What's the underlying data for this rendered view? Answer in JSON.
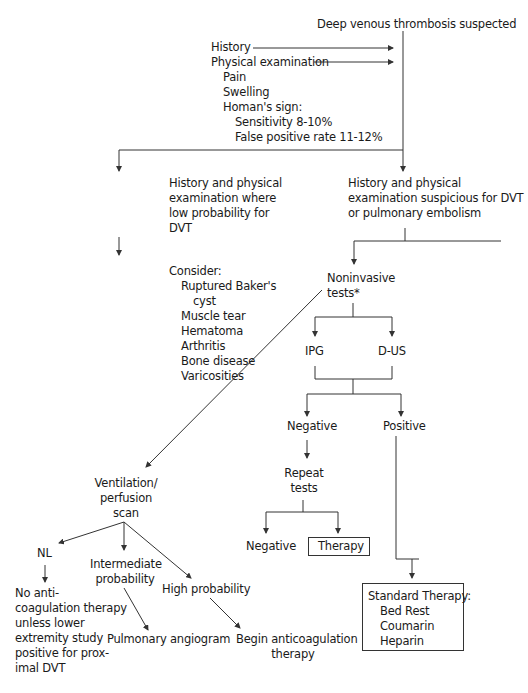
{
  "diagram": {
    "title": "Deep venous thrombosis suspected",
    "inputs": {
      "history": "History",
      "physical_exam": "Physical examination",
      "exam_items": [
        "Pain",
        "Swelling",
        "Homan's sign:"
      ],
      "homans_stats": [
        "Sensitivity 8-10%",
        "False positive rate 11-12%"
      ]
    },
    "low_prob": {
      "text": [
        "History and physical",
        "examination where",
        "low probability for",
        "DVT"
      ],
      "consider_label": "Consider:",
      "consider_items": [
        "Ruptured Baker's",
        "cyst",
        "Muscle tear",
        "Hematoma",
        "Arthritis",
        "Bone disease",
        "Varicosities"
      ]
    },
    "suspicious": {
      "text": [
        "History and physical",
        "examination suspicious for DVT",
        "or pulmonary embolism"
      ]
    },
    "noninvasive": {
      "text": [
        "Noninvasive",
        "tests*"
      ],
      "ipg": "IPG",
      "dus": "D-US",
      "negative": "Negative",
      "positive": "Positive",
      "repeat": [
        "Repeat",
        "tests"
      ],
      "repeat_negative": "Negative",
      "repeat_therapy": "Therapy"
    },
    "standard_therapy": {
      "title": "Standard Therapy:",
      "items": [
        "Bed Rest",
        "Coumarin",
        "Heparin"
      ]
    },
    "vq_scan": {
      "text": [
        "Ventilation/",
        "perfusion",
        "scan"
      ],
      "nl": "NL",
      "nl_result": [
        "No anti-",
        "coagulation therapy",
        "unless lower",
        "extremity study",
        "positive for prox-",
        "imal DVT"
      ],
      "intermediate": [
        "Intermediate",
        "probability"
      ],
      "intermediate_result": "Pulmonary angiogram",
      "high": "High probability",
      "high_result": [
        "Begin anticoagulation",
        "therapy"
      ]
    }
  }
}
